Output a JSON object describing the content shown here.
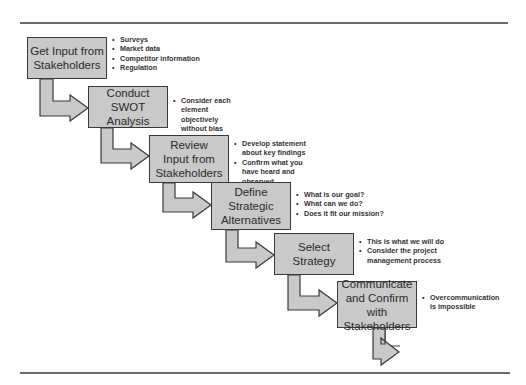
{
  "diagram": {
    "type": "process-flow",
    "colors": {
      "box_fill": "#c9c9c9",
      "border": "#3a3a3a",
      "rule": "#6a6a6a"
    },
    "steps": [
      {
        "label_lines": [
          "Get Input from",
          "Stakeholders"
        ],
        "notes": [
          "Surveys",
          "Market data",
          "Competitor information",
          "Regulation"
        ]
      },
      {
        "label_lines": [
          "Conduct SWOT",
          "Analysis"
        ],
        "notes": [
          "Consider each element objectively without bias"
        ]
      },
      {
        "label_lines": [
          "Review",
          "Input from",
          "Stakeholders"
        ],
        "notes": [
          "Develop statement about key findings",
          "Confirm what you have heard and observed"
        ]
      },
      {
        "label_lines": [
          "Define",
          "Strategic",
          "Alternatives"
        ],
        "notes": [
          "What is our goal?",
          "What can we do?",
          "Does it fit our mission?"
        ]
      },
      {
        "label_lines": [
          "Select",
          "Strategy"
        ],
        "notes": [
          "This is what we will do",
          "Consider the project management process"
        ]
      },
      {
        "label_lines": [
          "Communicate",
          "and Confirm with",
          "Stakeholders"
        ],
        "notes": [
          "Overcommunication is impossible"
        ]
      }
    ]
  }
}
